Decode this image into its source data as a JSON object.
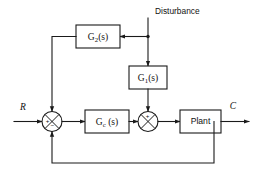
{
  "diagram": {
    "type": "control-system-block-diagram",
    "canvas": {
      "width": 264,
      "height": 178,
      "background": "#ffffff"
    },
    "line_color": "#1a1a1a",
    "blocks": [
      {
        "id": "g2",
        "label_main": "G",
        "label_sub": "2",
        "label_tail": "(s)",
        "label_text": "G2(s)",
        "x": 76,
        "y": 25,
        "w": 44,
        "h": 23
      },
      {
        "id": "g1",
        "label_main": "G",
        "label_sub": "1",
        "label_tail": "(s)",
        "label_text": "G1(s)",
        "x": 129,
        "y": 66,
        "w": 38,
        "h": 23
      },
      {
        "id": "gc",
        "label_main": "G",
        "label_sub": "c",
        "label_tail": " (s)",
        "label_text": "Gc (s)",
        "x": 85,
        "y": 110,
        "w": 44,
        "h": 23
      },
      {
        "id": "plant",
        "label_text": "Plant",
        "x": 180,
        "y": 110,
        "w": 41,
        "h": 23
      }
    ],
    "summing_junctions": [
      {
        "id": "sum-left",
        "cx": 52,
        "cy": 121.5,
        "r": 10,
        "signs": [
          {
            "text": "+",
            "dx": -4.5,
            "dy": -0.5
          },
          {
            "text": "-",
            "dx": 0.5,
            "dy": 5.2
          }
        ]
      },
      {
        "id": "sum-right",
        "cx": 148,
        "cy": 121.5,
        "r": 10,
        "signs": [
          {
            "text": "+",
            "dx": -0.5,
            "dy": -5.0
          }
        ]
      }
    ],
    "signals": [
      {
        "id": "input-r",
        "label": "R",
        "x": 23,
        "y": 108
      },
      {
        "id": "output-c",
        "label": "C",
        "x": 233,
        "y": 107
      },
      {
        "id": "disturbance",
        "label": "Disturbance",
        "x": 155,
        "y": 12
      }
    ],
    "paths": {
      "disturbance_entry_x": 148,
      "disturbance_top_y": 18,
      "g2_feed_y": 36.5,
      "feedback_y": 163,
      "output_tap_x": 214,
      "g2_return_x": 52
    }
  }
}
